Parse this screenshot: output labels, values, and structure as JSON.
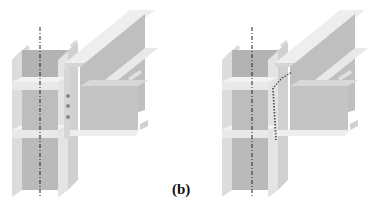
{
  "figure": {
    "caption_label": "(b)",
    "panels": [
      {
        "id": "left",
        "description": "I-beam column with bolted beam connection (shear tab with bolts)",
        "connection": "bolted"
      },
      {
        "id": "right",
        "description": "I-beam column with welded beam connection (weld line shown hatched)",
        "connection": "welded"
      }
    ],
    "colors": {
      "steel_light": "#e6e6e6",
      "steel_mid": "#c8c8c8",
      "steel_dark": "#a9a9a9",
      "centerline": "#222222"
    }
  }
}
